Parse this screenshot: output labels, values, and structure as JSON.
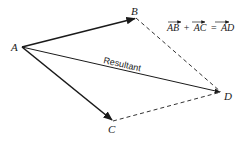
{
  "diagram": {
    "type": "vector-addition-parallelogram",
    "points": {
      "A": {
        "label": "A",
        "x": 22,
        "y": 47
      },
      "B": {
        "label": "B",
        "x": 136,
        "y": 18
      },
      "C": {
        "label": "C",
        "x": 113,
        "y": 121
      },
      "D": {
        "label": "D",
        "x": 221,
        "y": 92
      }
    },
    "vectors": [
      {
        "from": "A",
        "to": "B",
        "style": "solid-bold-arrow"
      },
      {
        "from": "A",
        "to": "C",
        "style": "solid-bold-arrow"
      },
      {
        "from": "A",
        "to": "D",
        "style": "solid-arrow",
        "label": "Resultant"
      }
    ],
    "dashed_edges": [
      {
        "from": "B",
        "to": "D"
      },
      {
        "from": "C",
        "to": "D"
      }
    ],
    "resultant_label": "Resultant",
    "equation": {
      "term1": "AB",
      "plus": "+",
      "term2": "AC",
      "equals": "=",
      "result": "AD"
    },
    "colors": {
      "ink": "#1a1a1a",
      "background": "#ffffff"
    }
  }
}
